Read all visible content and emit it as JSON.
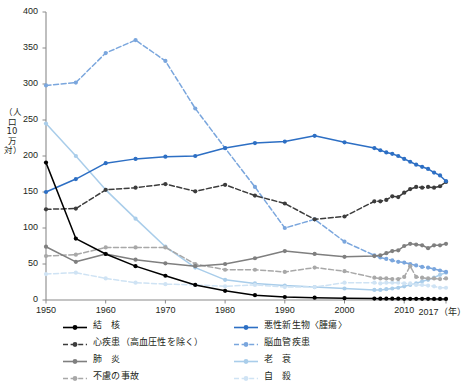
{
  "chart_data": {
    "type": "line",
    "title": "",
    "xlabel": "年",
    "ylabel": "（人口10万対）",
    "xlim": [
      1950,
      2017
    ],
    "ylim": [
      0,
      400
    ],
    "yticks": [
      0,
      50,
      100,
      150,
      200,
      250,
      300,
      350,
      400
    ],
    "xticks": [
      1950,
      1960,
      1970,
      1980,
      1990,
      2000,
      2010,
      2017
    ],
    "xtick_labels": [
      "1950",
      "1960",
      "1970",
      "1980",
      "1990",
      "2000",
      "2010",
      "2017"
    ],
    "xaxis_unit_label": "（年）",
    "grid": false,
    "legend_position": "bottom",
    "series": [
      {
        "name": "結　核",
        "color": "#000000",
        "style": "solid",
        "x": [
          1950,
          1955,
          1960,
          1965,
          1970,
          1975,
          1980,
          1985,
          1990,
          1995,
          2000,
          2005,
          2006,
          2007,
          2008,
          2009,
          2010,
          2011,
          2012,
          2013,
          2014,
          2015,
          2016,
          2017
        ],
        "values": [
          190.8,
          85.3,
          63.9,
          47.0,
          33.7,
          20.9,
          12.8,
          6.7,
          4.2,
          3.2,
          2.5,
          2.0,
          1.9,
          1.9,
          1.9,
          1.9,
          1.7,
          1.7,
          1.7,
          1.7,
          1.7,
          1.5,
          1.5,
          1.5
        ]
      },
      {
        "name": "心疾患（高血圧性を除く）",
        "color": "#3c3c3c",
        "style": "dashed",
        "x": [
          1950,
          1955,
          1960,
          1965,
          1970,
          1975,
          1980,
          1985,
          1990,
          1995,
          2000,
          2005,
          2006,
          2007,
          2008,
          2009,
          2010,
          2011,
          2012,
          2013,
          2014,
          2015,
          2016,
          2017
        ],
        "values": [
          126.0,
          127.0,
          153.0,
          156.0,
          161.0,
          151.0,
          160.0,
          145.0,
          134.0,
          112.0,
          116.0,
          137.0,
          137.0,
          139.0,
          144.0,
          143.0,
          149.0,
          154.0,
          157.0,
          156.0,
          157.0,
          156.0,
          158.0,
          164.0
        ]
      },
      {
        "name": "肺　炎",
        "color": "#7f7f7f",
        "style": "solid",
        "x": [
          1950,
          1955,
          1960,
          1965,
          1970,
          1975,
          1980,
          1985,
          1990,
          1995,
          2000,
          2005,
          2006,
          2007,
          2008,
          2009,
          2010,
          2011,
          2012,
          2013,
          2014,
          2015,
          2016,
          2017
        ],
        "values": [
          74.0,
          53.0,
          64.0,
          56.0,
          51.0,
          47.0,
          50.0,
          58.0,
          68.0,
          64.0,
          60.0,
          61.0,
          62.0,
          65.0,
          68.0,
          69.0,
          75.0,
          78.0,
          77.0,
          76.0,
          72.0,
          76.0,
          76.0,
          78.0
        ]
      },
      {
        "name": "不慮の事故",
        "color": "#a8a8a8",
        "style": "dashed",
        "x": [
          1950,
          1955,
          1960,
          1965,
          1970,
          1975,
          1980,
          1985,
          1990,
          1995,
          2000,
          2005,
          2006,
          2007,
          2008,
          2009,
          2010,
          2011,
          2012,
          2013,
          2014,
          2015,
          2016,
          2017
        ],
        "values": [
          61.0,
          63.0,
          73.0,
          73.0,
          73.0,
          50.0,
          42.0,
          42.0,
          39.0,
          45.0,
          40.0,
          31.0,
          30.0,
          30.0,
          29.0,
          29.0,
          32.0,
          47.0,
          32.0,
          31.0,
          30.0,
          30.0,
          29.0,
          30.0
        ]
      },
      {
        "name": "悪性新生物〈腫瘍〉",
        "color": "#2d6fc4",
        "style": "solid",
        "x": [
          1950,
          1955,
          1960,
          1965,
          1970,
          1975,
          1980,
          1985,
          1990,
          1995,
          2000,
          2005,
          2006,
          2007,
          2008,
          2009,
          2010,
          2011,
          2012,
          2013,
          2014,
          2015,
          2016,
          2017
        ],
        "values": [
          150.0,
          168.0,
          190.0,
          196.0,
          199.0,
          200.0,
          211.0,
          218.0,
          220.0,
          228.0,
          219.0,
          211.0,
          208.0,
          205.0,
          203.0,
          200.0,
          196.0,
          192.0,
          188.0,
          185.0,
          182.0,
          177.0,
          173.0,
          165.0
        ]
      },
      {
        "name": "脳血管疾患",
        "color": "#7aa6dd",
        "style": "dashed",
        "x": [
          1950,
          1955,
          1960,
          1965,
          1970,
          1975,
          1980,
          1985,
          1990,
          1995,
          2000,
          2005,
          2006,
          2007,
          2008,
          2009,
          2010,
          2011,
          2012,
          2013,
          2014,
          2015,
          2016,
          2017
        ],
        "values": [
          298.0,
          302.0,
          343.0,
          361.0,
          332.0,
          266.0,
          211.0,
          157.0,
          100.0,
          112.0,
          81.0,
          62.0,
          59.0,
          57.0,
          55.0,
          53.0,
          52.0,
          50.0,
          48.0,
          46.0,
          45.0,
          43.0,
          41.0,
          39.0
        ]
      },
      {
        "name": "老　衰",
        "color": "#a9cdea",
        "style": "solid",
        "x": [
          1950,
          1955,
          1960,
          1965,
          1970,
          1975,
          1980,
          1985,
          1990,
          1995,
          2000,
          2005,
          2006,
          2007,
          2008,
          2009,
          2010,
          2011,
          2012,
          2013,
          2014,
          2015,
          2016,
          2017
        ],
        "values": [
          245.0,
          200.0,
          153.0,
          113.0,
          74.0,
          45.0,
          28.0,
          23.0,
          20.0,
          18.0,
          16.0,
          14.0,
          14.0,
          15.0,
          16.0,
          17.0,
          19.0,
          21.0,
          23.0,
          26.0,
          28.0,
          31.0,
          35.0,
          38.0
        ]
      },
      {
        "name": "自　殺",
        "color": "#cfe3f4",
        "style": "dashed",
        "x": [
          1950,
          1955,
          1960,
          1965,
          1970,
          1975,
          1980,
          1985,
          1990,
          1995,
          2000,
          2005,
          2006,
          2007,
          2008,
          2009,
          2010,
          2011,
          2012,
          2013,
          2014,
          2015,
          2016,
          2017
        ],
        "values": [
          36.0,
          38.0,
          30.0,
          24.0,
          22.0,
          21.0,
          19.0,
          21.0,
          18.0,
          18.0,
          24.0,
          24.0,
          23.0,
          24.0,
          24.0,
          24.0,
          23.0,
          23.0,
          21.0,
          21.0,
          20.0,
          19.0,
          17.0,
          17.0
        ]
      }
    ]
  },
  "axis": {
    "y_label_text": "（人口10万対）",
    "x_unit": "（年）"
  },
  "legend": {
    "left_column": [
      {
        "label": "結　核",
        "color": "#000000",
        "style": "solid",
        "icon": "line-marker-icon"
      },
      {
        "label": "心疾患（高血圧性を除く）",
        "color": "#3c3c3c",
        "style": "dashed",
        "icon": "line-marker-icon"
      },
      {
        "label": "肺　炎",
        "color": "#7f7f7f",
        "style": "solid",
        "icon": "line-marker-icon"
      },
      {
        "label": "不慮の事故",
        "color": "#a8a8a8",
        "style": "dashed",
        "icon": "line-marker-icon"
      }
    ],
    "right_column": [
      {
        "label": "悪性新生物〈腫瘍〉",
        "color": "#2d6fc4",
        "style": "solid",
        "icon": "line-marker-icon"
      },
      {
        "label": "脳血管疾患",
        "color": "#7aa6dd",
        "style": "dashed",
        "icon": "line-marker-icon"
      },
      {
        "label": "老　衰",
        "color": "#a9cdea",
        "style": "solid",
        "icon": "line-marker-icon"
      },
      {
        "label": "自　殺",
        "color": "#cfe3f4",
        "style": "dashed",
        "icon": "line-marker-icon"
      }
    ]
  }
}
